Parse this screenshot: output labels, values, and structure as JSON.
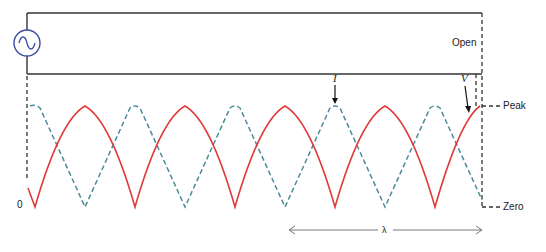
{
  "diagram": {
    "labels": {
      "open": "Open",
      "peak": "Peak",
      "zero": "Zero",
      "origin": "0",
      "current": "I",
      "voltage": "V",
      "wavelength": "λ"
    },
    "colors": {
      "line": "#333333",
      "source": "#3a4fa0",
      "voltage_curve": "#e03a3a",
      "current_curve": "#4a8a9a",
      "arrow": "#777777"
    },
    "icons": {
      "source": "ac-source-icon"
    }
  }
}
